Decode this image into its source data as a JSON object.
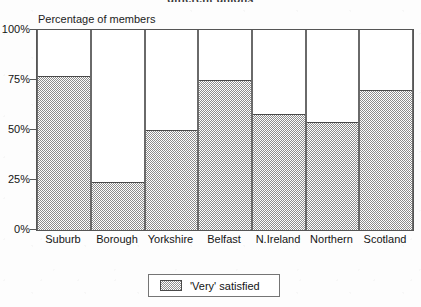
{
  "document": {
    "clipped_title": "different unions"
  },
  "chart_data": {
    "type": "bar",
    "title": "different unions",
    "ylabel": "Percentage of members",
    "xlabel": "",
    "categories": [
      "Suburb",
      "Borough",
      "Yorkshire",
      "Belfast",
      "N.Ireland",
      "Northern",
      "Scotland"
    ],
    "values": [
      77,
      24,
      50,
      75,
      58,
      54,
      70
    ],
    "series": [
      {
        "name": "'Very' satisfied",
        "values": [
          77,
          24,
          50,
          75,
          58,
          54,
          70
        ]
      }
    ],
    "ylim": [
      0,
      100
    ],
    "ytick_labels": [
      "100%",
      "75%",
      "50%",
      "25%",
      "0%"
    ],
    "ytick_values": [
      100,
      75,
      50,
      25,
      0
    ],
    "grid": false,
    "legend_position": "bottom-center",
    "fill_style": "checkerboard-gray",
    "colors": {
      "bar_fill": "#8d8d8d",
      "bar_outline": "#4a4a4a",
      "frame": "#555555",
      "background": "#ffffff",
      "text": "#141414"
    }
  },
  "legend": {
    "entries": [
      {
        "label": "'Very' satisfied"
      }
    ]
  }
}
